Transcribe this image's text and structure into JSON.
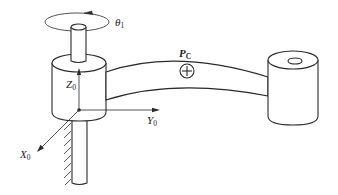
{
  "figure": {
    "labels": {
      "joint_angle": {
        "main": "θ",
        "sub": "1"
      },
      "z_axis": {
        "main": "Z",
        "sub": "0"
      },
      "y_axis": {
        "main": "Y",
        "sub": "0"
      },
      "x_axis": {
        "main": "X",
        "sub": "0"
      },
      "center_of_mass": {
        "main": "P",
        "sub": "C"
      }
    },
    "symbols": {
      "center_of_mass_marker": "circle-plus",
      "rotation_direction": "counter-clockwise-arrow",
      "ground": "hatched-fixed-support"
    }
  }
}
